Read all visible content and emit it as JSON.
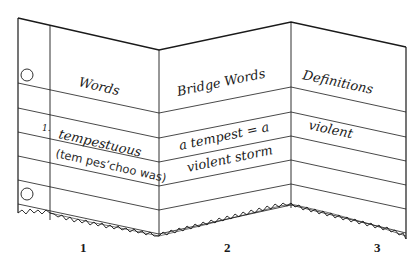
{
  "figure": {
    "panels": [
      {
        "number": "1",
        "header": "Words",
        "entry_index": "1.",
        "entry_word": "tempestuous",
        "entry_pronunciation": "(tem pes’choo was)"
      },
      {
        "number": "2",
        "header": "Bridge Words",
        "entry_line1": "a tempest = a",
        "entry_line2": "violent storm"
      },
      {
        "number": "3",
        "header": "Definitions",
        "entry_line1": "violent"
      }
    ],
    "colors": {
      "ink": "#1a1a1a",
      "paper": "#ffffff"
    }
  }
}
